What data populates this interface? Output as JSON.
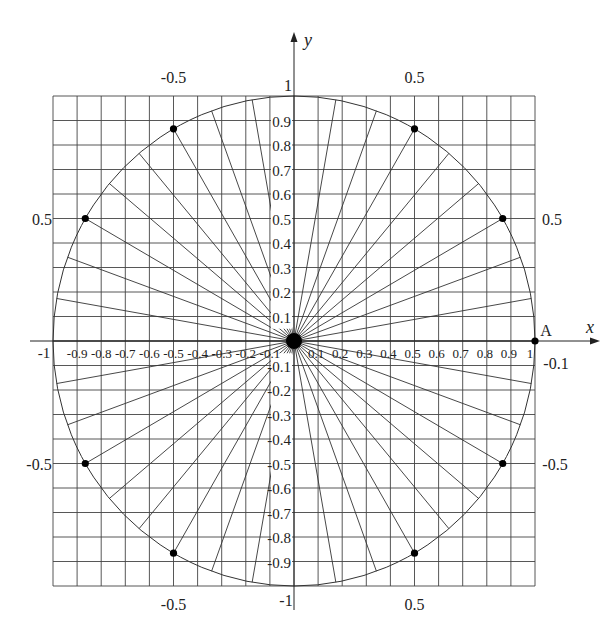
{
  "figure": {
    "axis_x_label": "x",
    "axis_y_label": "y",
    "point_label": "A",
    "center": [
      294,
      341
    ],
    "unit_px": 241,
    "grid_step": 0.1,
    "ray_step_deg": 10,
    "dot_angles_deg": [
      0,
      30,
      60,
      120,
      150,
      210,
      240,
      300,
      330
    ],
    "x_tick_labels_neg": [
      "-0.9",
      "-0.8",
      "-0.7",
      "-0.6",
      "-0.5",
      "-0.4",
      "-0.3",
      "-0.2",
      "-0.1"
    ],
    "x_tick_labels_pos": [
      "0.1",
      "0.2",
      "0.3",
      "0.4",
      "0.5",
      "0.6",
      "0.7",
      "0.8",
      "0.9",
      "1"
    ],
    "y_tick_labels_pos": [
      "0.1",
      "0.2",
      "0.3",
      "0.4",
      "0.5",
      "0.6",
      "0.7",
      "0.8",
      "0.9"
    ],
    "y_tick_labels_neg": [
      "-0.1",
      "-0.2",
      "-0.3",
      "-0.4",
      "-0.5",
      "-0.6",
      "-0.7",
      "-0.8",
      "-0.9"
    ],
    "outer_labels": {
      "left_x": "-1",
      "top_y": "1",
      "bottom_y": "-1",
      "top_left": "-0.5",
      "top_right": "0.5",
      "bottom_left": "-0.5",
      "bottom_right": "0.5",
      "left_upper": "0.5",
      "left_lower": "-0.5",
      "right_upper": "0.5",
      "right_lower": "-0.5",
      "right_near_axis": "-0.1"
    }
  }
}
